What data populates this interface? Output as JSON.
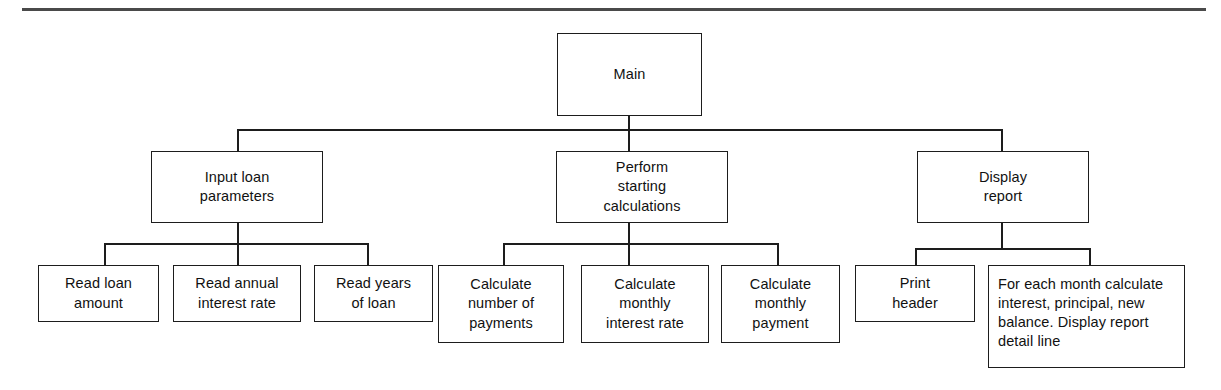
{
  "diagram": {
    "type": "hierarchy-structure-chart",
    "colors": {
      "box_border": "#1d1d1d",
      "connector": "#1d1d1d",
      "background": "#ffffff",
      "top_rule": "#4a4a4a",
      "text": "#111111"
    },
    "levels": [
      {
        "level": 1,
        "nodes": [
          {
            "id": "main",
            "label": "Main"
          }
        ]
      },
      {
        "level": 2,
        "nodes": [
          {
            "id": "input-loan-parameters",
            "label": "Input loan\nparameters"
          },
          {
            "id": "perform-starting-calculations",
            "label": "Perform\nstarting\ncalculations"
          },
          {
            "id": "display-report",
            "label": "Display\nreport"
          }
        ]
      },
      {
        "level": 3,
        "nodes": [
          {
            "id": "read-loan-amount",
            "label": "Read loan\namount",
            "parent": "input-loan-parameters"
          },
          {
            "id": "read-annual-interest-rate",
            "label": "Read annual\ninterest rate",
            "parent": "input-loan-parameters"
          },
          {
            "id": "read-years-of-loan",
            "label": "Read years\nof loan",
            "parent": "input-loan-parameters"
          },
          {
            "id": "calculate-number-of-payments",
            "label": "Calculate\nnumber of\npayments",
            "parent": "perform-starting-calculations"
          },
          {
            "id": "calculate-monthly-interest-rate",
            "label": "Calculate\nmonthly\ninterest rate",
            "parent": "perform-starting-calculations"
          },
          {
            "id": "calculate-monthly-payment",
            "label": "Calculate\nmonthly\npayment",
            "parent": "perform-starting-calculations"
          },
          {
            "id": "print-header",
            "label": "Print\nheader",
            "parent": "display-report"
          },
          {
            "id": "for-each-month-detail",
            "label": "For each month calculate interest, principal, new balance. Display report detail line",
            "parent": "display-report"
          }
        ]
      }
    ]
  }
}
